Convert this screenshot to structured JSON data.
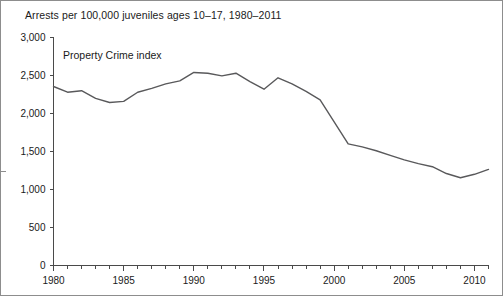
{
  "figure": {
    "title": "Arrests per 100,000 juveniles ages 10–17, 1980–2011",
    "series_label": "Property Crime index",
    "line_color": "#59595b",
    "axis_color": "#4a4a4a",
    "border_color": "#8d8d8d",
    "background": "#ffffff"
  },
  "chart_data": {
    "type": "line",
    "title": "Arrests per 100,000 juveniles ages 10–17, 1980–2011",
    "xlabel": "",
    "ylabel": "",
    "xlim": [
      1980,
      2011
    ],
    "ylim": [
      0,
      3000
    ],
    "grid": false,
    "legend_position": "inline-annotation",
    "annotations": [
      {
        "text": "Property Crime index",
        "x": 1981.5,
        "y": 2780
      }
    ],
    "y_ticks": [
      0,
      500,
      1000,
      1500,
      2000,
      2500,
      3000
    ],
    "y_tick_labels": [
      "0",
      "500",
      "1,000",
      "1,500",
      "2,000",
      "2,500",
      "3,000"
    ],
    "x_ticks": [
      1980,
      1981,
      1982,
      1983,
      1984,
      1985,
      1986,
      1987,
      1988,
      1989,
      1990,
      1991,
      1992,
      1993,
      1994,
      1995,
      1996,
      1997,
      1998,
      1999,
      2000,
      2001,
      2002,
      2003,
      2004,
      2005,
      2006,
      2007,
      2008,
      2009,
      2010,
      2011
    ],
    "x_tick_labels": [
      "1980",
      "",
      "",
      "",
      "",
      "1985",
      "",
      "",
      "",
      "",
      "1990",
      "",
      "",
      "",
      "",
      "1995",
      "",
      "",
      "",
      "",
      "2000",
      "",
      "",
      "",
      "",
      "2005",
      "",
      "",
      "",
      "",
      "2010",
      ""
    ],
    "x_major_labels": [
      "1980",
      "1985",
      "1990",
      "1995",
      "2000",
      "2005",
      "2010"
    ],
    "series": [
      {
        "name": "Property Crime index",
        "color": "#59595b",
        "x": [
          1980,
          1981,
          1982,
          1983,
          1984,
          1985,
          1986,
          1987,
          1988,
          1989,
          1990,
          1991,
          1992,
          1993,
          1994,
          1995,
          1996,
          1997,
          1998,
          1999,
          2000,
          2001,
          2002,
          2003,
          2004,
          2005,
          2006,
          2007,
          2008,
          2009,
          2010,
          2011
        ],
        "values": [
          2355,
          2280,
          2300,
          2200,
          2145,
          2160,
          2280,
          2330,
          2390,
          2430,
          2540,
          2530,
          2495,
          2530,
          2420,
          2320,
          2470,
          2390,
          2290,
          2180,
          1890,
          1600,
          1560,
          1510,
          1450,
          1390,
          1340,
          1300,
          1210,
          1155,
          1200,
          1265
        ]
      }
    ]
  }
}
